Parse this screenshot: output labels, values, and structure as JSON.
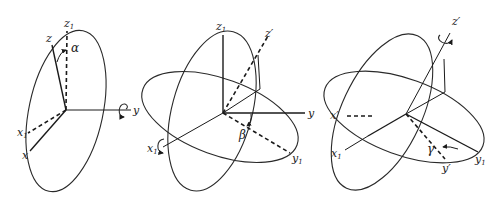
{
  "figure": {
    "panels": [
      {
        "id": "rotation-1",
        "rotation_axis": "y",
        "angle": "α",
        "labels": {
          "z1": {
            "base": "z",
            "sub": "1"
          },
          "z": {
            "base": "z"
          },
          "alpha": "α",
          "y": {
            "base": "y"
          },
          "x1": {
            "base": "x",
            "sub": "1"
          },
          "x": {
            "base": "x"
          }
        }
      },
      {
        "id": "rotation-2",
        "rotation_axis": "x1",
        "angle": "β",
        "labels": {
          "z1": {
            "base": "z",
            "sub": "1"
          },
          "zprime": {
            "base": "z′"
          },
          "y": {
            "base": "y"
          },
          "beta": "β",
          "x1": {
            "base": "x",
            "sub": "1"
          },
          "y1": {
            "base": "y",
            "sub": "1"
          }
        }
      },
      {
        "id": "rotation-3",
        "rotation_axis": "z′",
        "angle": "γ",
        "labels": {
          "zprime": {
            "base": "z′"
          },
          "xprime": {
            "base": "x′"
          },
          "x1": {
            "base": "x",
            "sub": "1"
          },
          "gamma": "γ",
          "yprime": {
            "base": "y′"
          },
          "y1": {
            "base": "y",
            "sub": "1"
          }
        }
      }
    ]
  }
}
